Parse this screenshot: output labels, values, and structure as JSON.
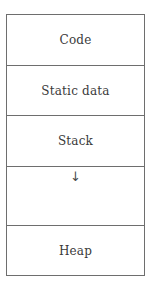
{
  "diagram": {
    "segments": [
      {
        "id": "code",
        "label": "Code"
      },
      {
        "id": "static",
        "label": "Static data"
      },
      {
        "id": "stack",
        "label": "Stack"
      },
      {
        "id": "free",
        "label": "",
        "arrow": "↓",
        "arrow_meaning": "stack grows downward"
      },
      {
        "id": "heap",
        "label": "Heap"
      }
    ],
    "colors": {
      "border": "#6e6e6e",
      "text": "#3a3a3a",
      "background": "#ffffff"
    }
  }
}
